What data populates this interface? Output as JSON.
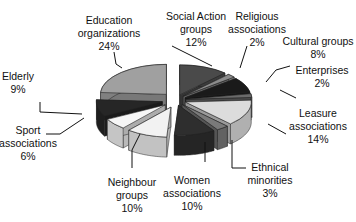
{
  "chart_data": {
    "type": "pie",
    "style": "3d-exploded",
    "title": "",
    "start": "top, clockwise",
    "slices": [
      {
        "label": "Social Action groups",
        "lines": [
          "Social Action",
          "groups",
          "12%"
        ],
        "value": 12,
        "color": "#4a4a4a"
      },
      {
        "label": "Religious associations",
        "lines": [
          "Religious",
          "associations",
          "2%"
        ],
        "value": 2,
        "color": "#8c8c8c"
      },
      {
        "label": "Cultural groups",
        "lines": [
          "Cultural groups",
          "8%"
        ],
        "value": 8,
        "color": "#1a1a1a"
      },
      {
        "label": "Enterprises",
        "lines": [
          "Enterprises",
          "2%"
        ],
        "value": 2,
        "color": "#6a6a6a"
      },
      {
        "label": "Leasure associations",
        "lines": [
          "Leasure",
          "associations",
          "14%"
        ],
        "value": 14,
        "color": "#dcdcdc"
      },
      {
        "label": "Ethnical minorities",
        "lines": [
          "Ethnical",
          "minorities",
          "3%"
        ],
        "value": 3,
        "color": "#7a7a7a"
      },
      {
        "label": "Women associations",
        "lines": [
          "Women",
          "associations",
          "10%"
        ],
        "value": 10,
        "color": "#2e2e2e"
      },
      {
        "label": "Neighbour groups",
        "lines": [
          "Neighbour",
          "groups",
          "10%"
        ],
        "value": 10,
        "color": "#f2f2f2"
      },
      {
        "label": "Sport associations",
        "lines": [
          "Sport",
          "associations",
          "6%"
        ],
        "value": 6,
        "color": "#f6f6f6"
      },
      {
        "label": "Elderly",
        "lines": [
          "Elderly",
          "9%"
        ],
        "value": 9,
        "color": "#262626"
      },
      {
        "label": "Education organizations",
        "lines": [
          "Education",
          "organizations",
          "24%"
        ],
        "value": 24,
        "color": "#a0a0a0"
      }
    ]
  }
}
